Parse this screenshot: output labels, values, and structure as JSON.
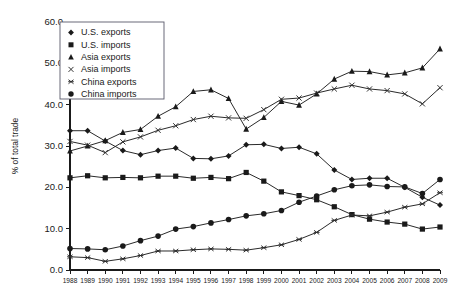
{
  "chart_data": {
    "type": "line",
    "title": "",
    "xlabel": "",
    "ylabel": "% of total trade",
    "xlim": [
      1988,
      2009
    ],
    "ylim": [
      0.0,
      60.0
    ],
    "ytick_step": 10.0,
    "grid": false,
    "legend_position": "top-left",
    "ytick_labels": [
      "0.0",
      "10.0",
      "20.0",
      "30.0",
      "40.0",
      "50.0",
      "60.0"
    ],
    "ytick_values": [
      0.0,
      10.0,
      20.0,
      30.0,
      40.0,
      50.0,
      60.0
    ],
    "categories": [
      "1988",
      "1989",
      "1990",
      "1991",
      "1992",
      "1993",
      "1994",
      "1995",
      "1996",
      "1997",
      "1998",
      "1999",
      "2000",
      "2001",
      "2002",
      "2003",
      "2004",
      "2005",
      "2006",
      "2007",
      "2008",
      "2009"
    ],
    "series": [
      {
        "name": "U.S. exports",
        "marker": "diamond",
        "values": [
          33.7,
          33.7,
          31.2,
          28.9,
          27.9,
          28.9,
          29.5,
          27.0,
          26.9,
          27.6,
          30.3,
          30.4,
          29.4,
          29.7,
          28.1,
          24.2,
          21.9,
          22.2,
          22.2,
          20.0,
          17.6,
          15.7
        ]
      },
      {
        "name": "U.S. imports",
        "marker": "square",
        "values": [
          22.3,
          22.8,
          22.3,
          22.4,
          22.3,
          22.7,
          22.7,
          22.2,
          22.4,
          22.1,
          23.6,
          21.5,
          18.9,
          18.0,
          17.0,
          15.3,
          13.4,
          12.3,
          11.6,
          11.1,
          9.9,
          10.4
        ]
      },
      {
        "name": "Asia exports",
        "marker": "triangle",
        "values": [
          28.8,
          30.0,
          31.3,
          33.3,
          34.0,
          37.2,
          39.5,
          43.2,
          43.6,
          41.5,
          34.1,
          36.9,
          40.8,
          39.9,
          42.6,
          46.2,
          48.1,
          48.0,
          47.2,
          47.7,
          48.9,
          53.5
        ]
      },
      {
        "name": "Asia imports",
        "marker": "cross",
        "values": [
          31.1,
          30.2,
          28.4,
          31.0,
          32.2,
          33.8,
          34.9,
          36.4,
          37.2,
          36.8,
          36.7,
          38.8,
          41.3,
          41.6,
          42.8,
          43.8,
          44.7,
          43.8,
          43.4,
          42.6,
          40.2,
          44.1
        ]
      },
      {
        "name": "China exports",
        "marker": "asterisk",
        "values": [
          3.2,
          3.0,
          2.1,
          2.7,
          3.5,
          4.6,
          4.6,
          4.9,
          5.1,
          5.0,
          4.8,
          5.4,
          6.1,
          7.4,
          9.1,
          12.0,
          13.3,
          13.1,
          14.0,
          15.2,
          16.0,
          18.7
        ]
      },
      {
        "name": "China imports",
        "marker": "circle",
        "values": [
          5.2,
          5.1,
          4.9,
          5.8,
          7.1,
          8.2,
          9.9,
          10.5,
          11.4,
          12.2,
          13.1,
          13.6,
          14.4,
          16.4,
          17.9,
          19.4,
          20.4,
          20.6,
          20.2,
          20.1,
          18.5,
          21.9
        ]
      }
    ]
  }
}
